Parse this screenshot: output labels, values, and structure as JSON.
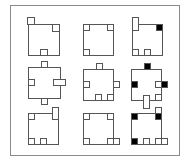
{
  "frame": {
    "x": 10.5,
    "y": 5.5,
    "w": 169,
    "h": 150,
    "stroke": "#8a8a8a"
  },
  "colors": {
    "stroke": "#555555",
    "fill_white": "#ffffff",
    "fill_black": "#000000"
  },
  "cells": [
    {
      "id": "r0c0",
      "box": [
        28.5,
        24.5,
        31,
        31
      ],
      "marks": [
        {
          "x": 27.5,
          "y": 17.5,
          "w": 7,
          "h": 7,
          "fill": "white"
        },
        {
          "x": 52.5,
          "y": 24.5,
          "w": 7,
          "h": 7,
          "fill": "white"
        },
        {
          "x": 40.5,
          "y": 49.5,
          "w": 7,
          "h": 6,
          "fill": "white"
        }
      ]
    },
    {
      "id": "r0c1",
      "box": [
        83.5,
        24.5,
        30,
        31
      ],
      "marks": [
        {
          "x": 83.5,
          "y": 24.5,
          "w": 6,
          "h": 6,
          "fill": "white"
        },
        {
          "x": 107.5,
          "y": 24.5,
          "w": 6,
          "h": 6,
          "fill": "white"
        },
        {
          "x": 83.5,
          "y": 49.5,
          "w": 6,
          "h": 6,
          "fill": "white"
        }
      ]
    },
    {
      "id": "r0c2",
      "box": [
        132.5,
        24.5,
        30,
        31
      ],
      "marks": [
        {
          "x": 132.5,
          "y": 17.5,
          "w": 6,
          "h": 13,
          "fill": "white"
        },
        {
          "x": 156.5,
          "y": 24.5,
          "w": 6,
          "h": 6,
          "fill": "black"
        },
        {
          "x": 132.5,
          "y": 49.5,
          "w": 6,
          "h": 6,
          "fill": "white"
        },
        {
          "x": 144.5,
          "y": 49.5,
          "w": 6,
          "h": 6,
          "fill": "white"
        }
      ]
    },
    {
      "id": "r1c0",
      "box": [
        28.5,
        67.5,
        32,
        31
      ],
      "marks": [
        {
          "x": 41.5,
          "y": 61.5,
          "w": 6,
          "h": 6,
          "fill": "white"
        },
        {
          "x": 28.5,
          "y": 79.5,
          "w": 6,
          "h": 6,
          "fill": "white"
        },
        {
          "x": 53.5,
          "y": 79.5,
          "w": 12,
          "h": 6,
          "fill": "white"
        },
        {
          "x": 41.5,
          "y": 98.5,
          "w": 6,
          "h": 6,
          "fill": "white"
        }
      ]
    },
    {
      "id": "r1c1",
      "box": [
        83.5,
        69.5,
        30,
        31
      ],
      "marks": [
        {
          "x": 96.5,
          "y": 63.5,
          "w": 6,
          "h": 6,
          "fill": "white"
        },
        {
          "x": 83.5,
          "y": 81.5,
          "w": 6,
          "h": 6,
          "fill": "white"
        },
        {
          "x": 113.5,
          "y": 81.5,
          "w": 6,
          "h": 6,
          "fill": "white"
        },
        {
          "x": 95.5,
          "y": 94.5,
          "w": 6,
          "h": 6,
          "fill": "white"
        },
        {
          "x": 107.5,
          "y": 94.5,
          "w": 6,
          "h": 6,
          "fill": "white"
        }
      ]
    },
    {
      "id": "r1c2",
      "box": [
        131.5,
        69.5,
        30,
        31
      ],
      "marks": [
        {
          "x": 144.5,
          "y": 63.5,
          "w": 6,
          "h": 6,
          "fill": "black"
        },
        {
          "x": 131.5,
          "y": 81.5,
          "w": 6,
          "h": 6,
          "fill": "black"
        },
        {
          "x": 155.5,
          "y": 81.5,
          "w": 6,
          "h": 6,
          "fill": "white"
        },
        {
          "x": 161.5,
          "y": 81.5,
          "w": 6,
          "h": 6,
          "fill": "black"
        },
        {
          "x": 143.5,
          "y": 95.5,
          "w": 6,
          "h": 13,
          "fill": "white"
        },
        {
          "x": 155.5,
          "y": 94.5,
          "w": 6,
          "h": 6,
          "fill": "white"
        }
      ]
    },
    {
      "id": "r2c0",
      "box": [
        28.5,
        113.5,
        30,
        31
      ],
      "marks": [
        {
          "x": 28.5,
          "y": 113.5,
          "w": 6,
          "h": 6,
          "fill": "white"
        },
        {
          "x": 52.5,
          "y": 107.5,
          "w": 6,
          "h": 12,
          "fill": "white"
        },
        {
          "x": 28.5,
          "y": 138.5,
          "w": 6,
          "h": 6,
          "fill": "white"
        },
        {
          "x": 40.5,
          "y": 138.5,
          "w": 6,
          "h": 6,
          "fill": "white"
        }
      ]
    },
    {
      "id": "r2c1",
      "box": [
        83.5,
        113.5,
        30,
        31
      ],
      "marks": [
        {
          "x": 83.5,
          "y": 113.5,
          "w": 6,
          "h": 6,
          "fill": "white"
        },
        {
          "x": 107.5,
          "y": 113.5,
          "w": 6,
          "h": 6,
          "fill": "white"
        },
        {
          "x": 83.5,
          "y": 138.5,
          "w": 6,
          "h": 6,
          "fill": "white"
        },
        {
          "x": 107.5,
          "y": 138.5,
          "w": 6,
          "h": 6,
          "fill": "white"
        },
        {
          "x": 113.5,
          "y": 138.5,
          "w": 6,
          "h": 6,
          "fill": "white"
        }
      ]
    },
    {
      "id": "r2c2",
      "box": [
        131.5,
        113.5,
        30,
        31
      ],
      "marks": [
        {
          "x": 131.5,
          "y": 113.5,
          "w": 6,
          "h": 6,
          "fill": "black"
        },
        {
          "x": 155.5,
          "y": 107.5,
          "w": 6,
          "h": 6,
          "fill": "white"
        },
        {
          "x": 155.5,
          "y": 113.5,
          "w": 6,
          "h": 6,
          "fill": "black"
        },
        {
          "x": 131.5,
          "y": 138.5,
          "w": 6,
          "h": 6,
          "fill": "black"
        },
        {
          "x": 143.5,
          "y": 138.5,
          "w": 6,
          "h": 6,
          "fill": "white"
        },
        {
          "x": 155.5,
          "y": 138.5,
          "w": 6,
          "h": 6,
          "fill": "white"
        },
        {
          "x": 161.5,
          "y": 138.5,
          "w": 6,
          "h": 6,
          "fill": "white"
        }
      ]
    }
  ]
}
